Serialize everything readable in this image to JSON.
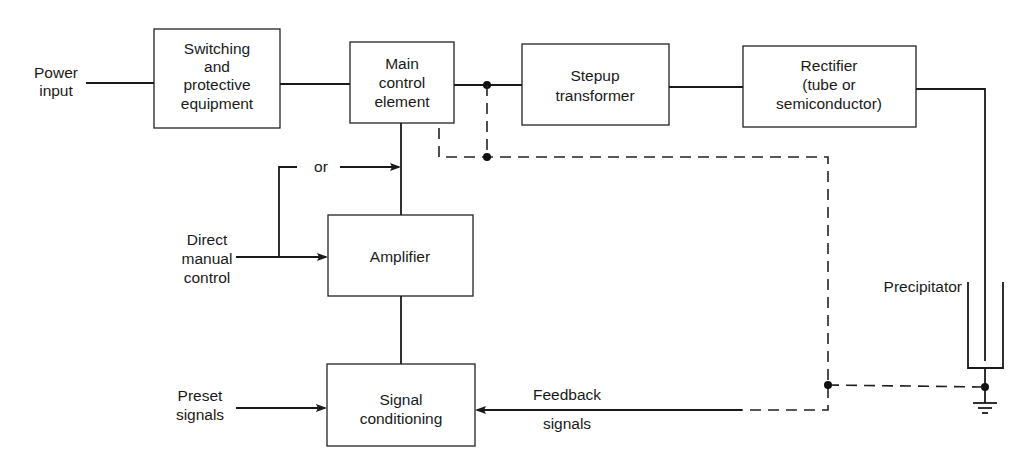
{
  "diagram": {
    "inputs": {
      "power_input": [
        "Power",
        "input"
      ],
      "direct_manual_control": [
        "Direct",
        "manual",
        "control"
      ],
      "or_label": "or",
      "preset_signals": [
        "Preset",
        "signals"
      ],
      "feedback_signals": [
        "Feedback",
        "signals"
      ]
    },
    "blocks": {
      "switching": [
        "Switching",
        "and",
        "protective",
        "equipment"
      ],
      "main_control": [
        "Main",
        "control",
        "element"
      ],
      "stepup": [
        "Stepup",
        "transformer"
      ],
      "rectifier": [
        "Rectifier",
        "(tube or",
        "semiconductor)"
      ],
      "amplifier": [
        "Amplifier"
      ],
      "signal_conditioning": [
        "Signal",
        "conditioning"
      ]
    },
    "output": {
      "precipitator": "Precipitator"
    },
    "legend": {
      "solid_line": "power / control path",
      "dashed_line": "feedback path"
    }
  }
}
